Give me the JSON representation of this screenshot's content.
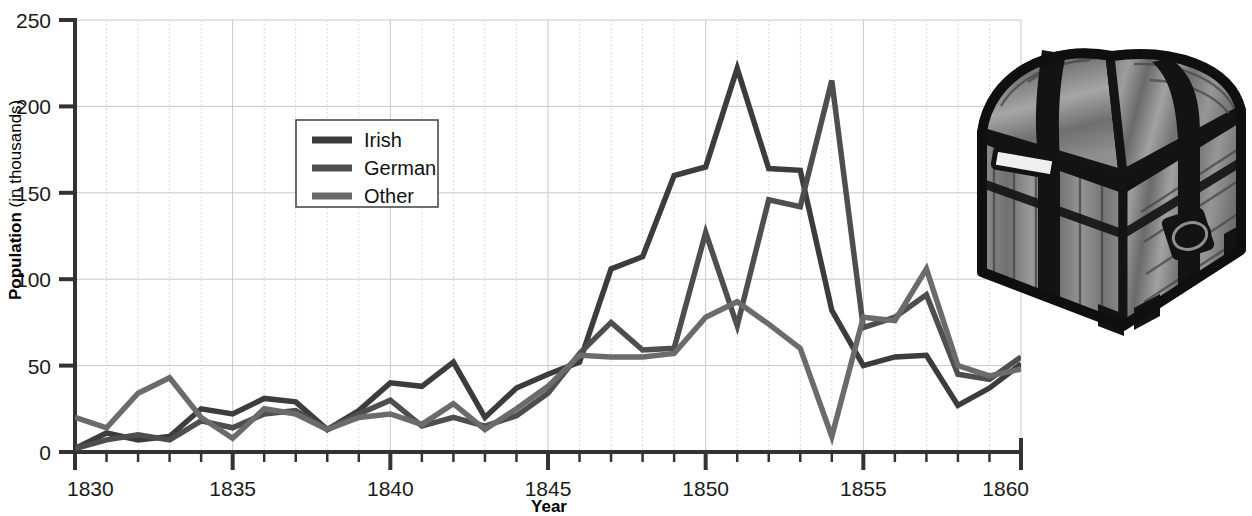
{
  "chart_data": {
    "type": "line",
    "title": "",
    "xlabel": "Year",
    "ylabel": "Population (in thousands)",
    "ylabel_bold_part": "Population",
    "ylabel_regular_part": " (in thousands)",
    "xlim": [
      1830,
      1860
    ],
    "ylim": [
      0,
      250
    ],
    "y_ticks": [
      0,
      50,
      100,
      150,
      200,
      250
    ],
    "y_tick_labels": [
      "0",
      "50",
      "100",
      "150",
      "200",
      "250"
    ],
    "x_ticks_major": [
      1830,
      1835,
      1840,
      1845,
      1850,
      1855,
      1860
    ],
    "x_tick_labels": [
      "1830",
      "1835",
      "1840",
      "1845",
      "1850",
      "1855",
      "1860"
    ],
    "x_ticks_minor_step": 1,
    "grid": true,
    "legend_position": "upper-left-inset",
    "x": [
      1830,
      1831,
      1832,
      1833,
      1834,
      1835,
      1836,
      1837,
      1838,
      1839,
      1840,
      1841,
      1842,
      1843,
      1844,
      1845,
      1846,
      1847,
      1848,
      1849,
      1850,
      1851,
      1852,
      1853,
      1854,
      1855,
      1856,
      1857,
      1858,
      1859,
      1860
    ],
    "series": [
      {
        "name": "Irish",
        "color": "#3c3c3c",
        "values": [
          2,
          11,
          7,
          9,
          25,
          22,
          31,
          29,
          13,
          24,
          40,
          38,
          52,
          20,
          37,
          45,
          52,
          106,
          113,
          160,
          165,
          222,
          164,
          163,
          82,
          50,
          55,
          56,
          27,
          37,
          51
        ]
      },
      {
        "name": "German",
        "color": "#4e4e4e",
        "values": [
          2,
          7,
          10,
          7,
          18,
          14,
          22,
          24,
          13,
          22,
          30,
          15,
          20,
          15,
          21,
          34,
          57,
          75,
          59,
          60,
          127,
          73,
          146,
          142,
          215,
          72,
          78,
          91,
          45,
          42,
          55
        ]
      },
      {
        "name": "Other",
        "color": "#6b6b6b",
        "values": [
          20,
          14,
          34,
          43,
          20,
          8,
          25,
          22,
          13,
          20,
          22,
          16,
          28,
          13,
          25,
          38,
          56,
          55,
          55,
          57,
          78,
          87,
          74,
          60,
          9,
          78,
          76,
          106,
          50,
          44,
          48
        ]
      }
    ]
  },
  "legend": {
    "entries": [
      {
        "label": "Irish"
      },
      {
        "label": "German"
      },
      {
        "label": "Other"
      }
    ]
  },
  "illustration": {
    "name": "treasure-chest",
    "description": "Grayscale drawing of a domed wooden steamer trunk with dark metal bands and a side ring handle"
  }
}
